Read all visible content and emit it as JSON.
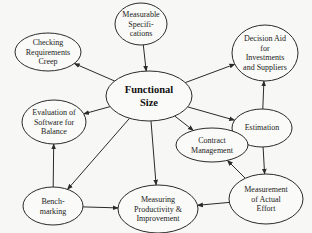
{
  "diagram": {
    "title": "",
    "nodes": [
      {
        "id": "measurable_specifications",
        "lines": [
          "Measurable",
          "Specifi-",
          "cations"
        ],
        "cx": 141,
        "cy": 24,
        "rx": 26,
        "ry": 21
      },
      {
        "id": "checking_requirements_creep",
        "lines": [
          "Checking",
          "Requirements",
          "Creep"
        ],
        "cx": 48,
        "cy": 52,
        "rx": 33,
        "ry": 19
      },
      {
        "id": "functional_size",
        "lines": [
          "Functional",
          "Size"
        ],
        "cx": 149,
        "cy": 96,
        "rx": 43,
        "ry": 25,
        "main": true
      },
      {
        "id": "decision_aid",
        "lines": [
          "Decision Aid",
          "for",
          "Investments",
          "and Suppliers"
        ],
        "cx": 265,
        "cy": 53,
        "rx": 33,
        "ry": 28
      },
      {
        "id": "evaluation_of_software",
        "lines": [
          "Evaluation of",
          "Software for",
          "Balance"
        ],
        "cx": 54,
        "cy": 122,
        "rx": 32,
        "ry": 22
      },
      {
        "id": "estimation",
        "lines": [
          "Estimation"
        ],
        "cx": 262,
        "cy": 128,
        "rx": 30,
        "ry": 19
      },
      {
        "id": "contract_management",
        "lines": [
          "Contract",
          "Management"
        ],
        "cx": 212,
        "cy": 145,
        "rx": 36,
        "ry": 17
      },
      {
        "id": "benchmarking",
        "lines": [
          "Bench-",
          "marking"
        ],
        "cx": 53,
        "cy": 206,
        "rx": 30,
        "ry": 19
      },
      {
        "id": "measuring_productivity",
        "lines": [
          "Measuring",
          "Productivity &",
          "Improvement"
        ],
        "cx": 158,
        "cy": 209,
        "rx": 40,
        "ry": 24
      },
      {
        "id": "measurement_actual_effort",
        "lines": [
          "Measurement",
          "of Actual",
          "Effort"
        ],
        "cx": 266,
        "cy": 199,
        "rx": 37,
        "ry": 25
      }
    ],
    "edges": [
      {
        "from": "functional_size",
        "to": "checking_requirements_creep"
      },
      {
        "from": "measurable_specifications",
        "to": "functional_size"
      },
      {
        "from": "functional_size",
        "to": "decision_aid"
      },
      {
        "from": "functional_size",
        "to": "evaluation_of_software"
      },
      {
        "from": "functional_size",
        "to": "estimation"
      },
      {
        "from": "functional_size",
        "to": "contract_management"
      },
      {
        "from": "functional_size",
        "to": "benchmarking"
      },
      {
        "from": "functional_size",
        "to": "measuring_productivity"
      },
      {
        "from": "estimation",
        "to": "decision_aid"
      },
      {
        "from": "estimation",
        "to": "contract_management"
      },
      {
        "from": "estimation",
        "to": "measurement_actual_effort"
      },
      {
        "from": "benchmarking",
        "to": "evaluation_of_software"
      },
      {
        "from": "benchmarking",
        "to": "measuring_productivity"
      },
      {
        "from": "measurement_actual_effort",
        "to": "measuring_productivity"
      },
      {
        "from": "measurement_actual_effort",
        "to": "contract_management"
      }
    ],
    "colors": {
      "stroke": "#2a2a2a",
      "fill": "#fafaf8",
      "text": "#222222",
      "background": "#f7f7f5"
    }
  }
}
